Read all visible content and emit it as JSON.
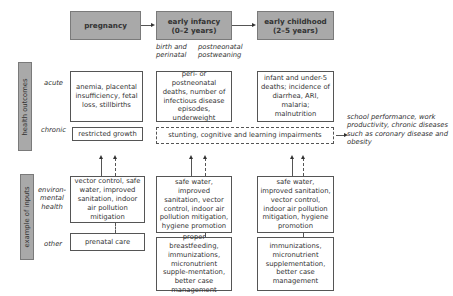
{
  "stages": [
    {
      "label": "pregnancy"
    },
    {
      "label": "early infancy\n(0–2 years)"
    },
    {
      "label": "early childhood\n(2–5 years)"
    }
  ],
  "infancy_sublabels": {
    "left": "birth and perinatal",
    "right": "postneonatal postweaning"
  },
  "side_labels": {
    "outcomes": "health outcomes",
    "inputs": "example of inputs"
  },
  "row_labels": {
    "acute": "acute",
    "chronic": "chronic",
    "env": "environ-\nmental\nhealth",
    "other": "other"
  },
  "acute": [
    "anemia, placental insufficiency, fetal loss, stillbirths",
    "peri- or postneonatal deaths, number of infectious disease episodes, underweight",
    "infant and under-5 deaths; incidence of diarrhea, ARI, malaria; malnutrition"
  ],
  "chronic": {
    "pregnancy": "restricted growth",
    "shared": "stunting, cognitive and learning impairments",
    "outcome": "school performance, work productivity, chronic diseases such as coronary disease and obesity"
  },
  "env": [
    "vector control, safe water, improved sanitation, indoor air pollution mitigation",
    "safe water, improved sanitation, vector control, indoor air pollution mitigation, hygiene promotion",
    "safe water, improved sanitation, vector control, indoor air pollution mitigation, hygiene promotion"
  ],
  "other": [
    "prenatal care",
    "proper breastfeeding, immunizations, micronutrient supple-mentation, better case management",
    "immunizations, micronutrient supplementation, better case management"
  ]
}
